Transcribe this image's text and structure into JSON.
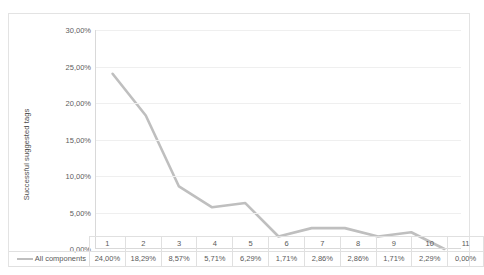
{
  "chart_data": {
    "type": "line",
    "title": "",
    "xlabel": "",
    "ylabel": "Successful suggested tags",
    "categories": [
      "1",
      "2",
      "3",
      "4",
      "5",
      "6",
      "7",
      "8",
      "9",
      "10",
      "11"
    ],
    "series": [
      {
        "name": "All components",
        "values": [
          24.0,
          18.29,
          8.57,
          5.71,
          6.29,
          1.71,
          2.86,
          2.86,
          1.71,
          2.29,
          0.0
        ],
        "value_labels": [
          "24,00%",
          "18,29%",
          "8,57%",
          "5,71%",
          "6,29%",
          "1,71%",
          "2,86%",
          "2,86%",
          "1,71%",
          "2,29%",
          "0,00%"
        ],
        "color": "#bfbfbf"
      }
    ],
    "ylim": [
      0,
      30
    ],
    "ytick_values": [
      0,
      5,
      10,
      15,
      20,
      25,
      30
    ],
    "ytick_labels": [
      "0,00%",
      "5,00%",
      "10,00%",
      "15,00%",
      "20,00%",
      "25,00%",
      "30,00%"
    ],
    "grid": "horizontal",
    "legend_position": "data-table-left",
    "has_data_table": true
  },
  "axis": {
    "y_title": "Successful suggested tags"
  },
  "legend": {
    "series_label": "All components"
  },
  "colors": {
    "series_line": "#bfbfbf",
    "gridline": "#efefef",
    "axis_line": "#d9d9d9",
    "border": "#e3e3e3",
    "text": "#5a5a5a"
  }
}
